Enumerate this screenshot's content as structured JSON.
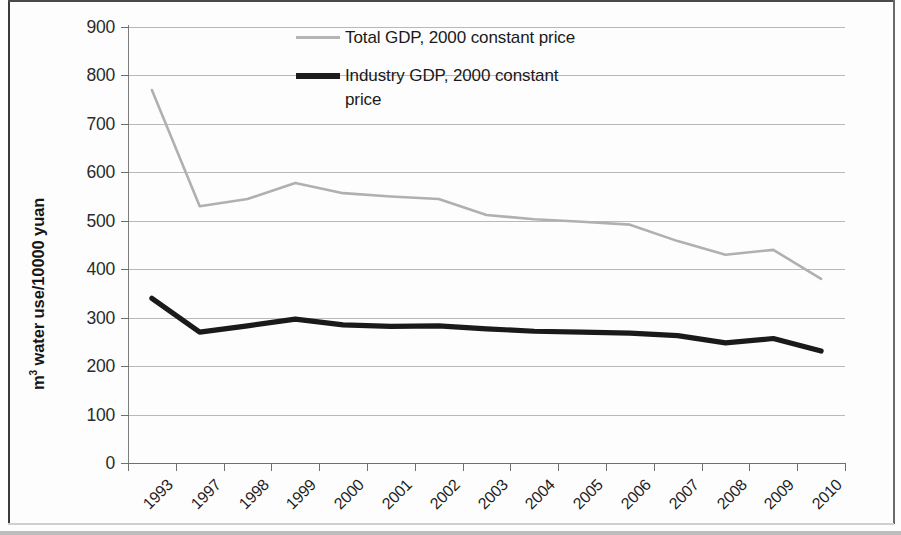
{
  "chart_data": {
    "type": "line",
    "title": "",
    "xlabel": "",
    "ylabel": "m³ water use/10000 yuan",
    "ylabel_prefix": "m",
    "ylabel_sup": "3",
    "ylabel_rest": " water use/10000 yuan",
    "ylim": [
      0,
      900
    ],
    "ytick_step": 100,
    "yticks": [
      "900",
      "800",
      "700",
      "600",
      "500",
      "400",
      "300",
      "200",
      "100",
      "0"
    ],
    "grid": true,
    "legend_position": "top-center",
    "categories": [
      "1993",
      "1997",
      "1998",
      "1999",
      "2000",
      "2001",
      "2002",
      "2003",
      "2004",
      "2005",
      "2006",
      "2007",
      "2008",
      "2009",
      "2010"
    ],
    "series": [
      {
        "name": "Total GDP, 2000 constant price",
        "color": "#b0b0b0",
        "line_width": 2.6,
        "values": [
          770,
          530,
          545,
          578,
          557,
          550,
          545,
          512,
          503,
          498,
          492,
          458,
          430,
          440,
          380
        ]
      },
      {
        "name": "Industry GDP, 2000 constant price",
        "color": "#1a1a1a",
        "line_width": 5.2,
        "values": [
          340,
          270,
          283,
          297,
          285,
          282,
          283,
          277,
          272,
          270,
          268,
          263,
          248,
          257,
          231
        ]
      }
    ]
  },
  "legend": {
    "items": [
      {
        "label": "Total GDP, 2000 constant price",
        "swatch": "total"
      },
      {
        "label": "Industry GDP, 2000 constant price",
        "swatch": "industry"
      }
    ]
  }
}
